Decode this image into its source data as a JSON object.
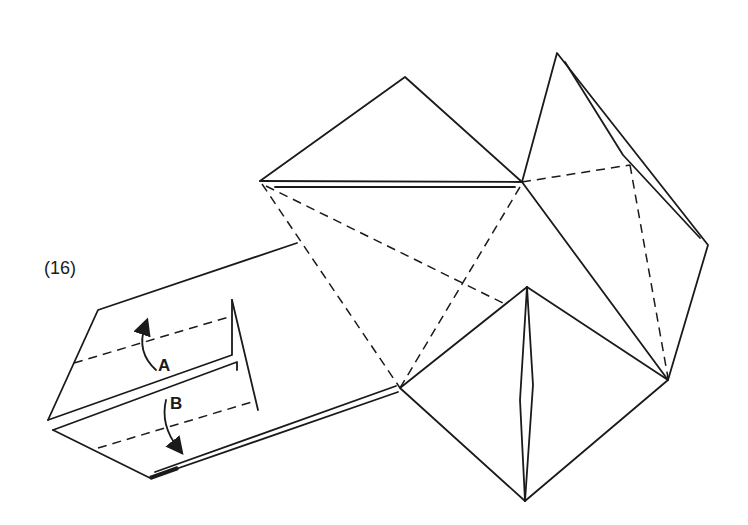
{
  "diagram": {
    "step_number": "(16)",
    "fold_labels": {
      "a": "A",
      "b": "B"
    },
    "colors": {
      "line": "#1a1a1a",
      "background": "#ffffff"
    },
    "elements": [
      {
        "id": "top-triangle",
        "type": "solid-polygon"
      },
      {
        "id": "right-flap",
        "type": "solid-polygon"
      },
      {
        "id": "bottom-diamond",
        "type": "solid-polygon"
      },
      {
        "id": "left-strip",
        "type": "solid-polygon"
      },
      {
        "id": "valley-fold-lines",
        "type": "dashed"
      },
      {
        "id": "fold-arrow-a",
        "type": "arrow",
        "direction": "up"
      },
      {
        "id": "fold-arrow-b",
        "type": "arrow",
        "direction": "down"
      }
    ]
  }
}
